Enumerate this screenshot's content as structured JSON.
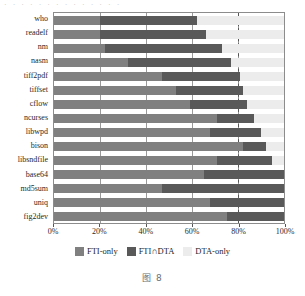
{
  "top_partial_text": "· · · · · · · · · · · · · ·",
  "caption": "图 8",
  "legend": {
    "position": "bottom-center",
    "items": [
      {
        "label": "FTI-only",
        "color": "#808080",
        "key": "fti_only"
      },
      {
        "label": "FTI∩DTA",
        "color": "#595959",
        "key": "fti_dta"
      },
      {
        "label": "DTA-only",
        "color": "#ececec",
        "key": "dta_only"
      }
    ]
  },
  "axis": {
    "ticks": [
      0,
      20,
      40,
      60,
      80,
      100
    ],
    "tick_labels": [
      "0%",
      "20%",
      "40%",
      "60%",
      "80%",
      "100%"
    ],
    "reference_line_at": 80
  },
  "chart_data": {
    "type": "bar",
    "orientation": "horizontal",
    "stacked": true,
    "normalized_percent": true,
    "title": "",
    "xlabel": "",
    "ylabel": "",
    "xlim": [
      0,
      100
    ],
    "grid": true,
    "legend_position": "bottom",
    "categories": [
      "who",
      "readelf",
      "nm",
      "nasm",
      "tiff2pdf",
      "tiffset",
      "cflow",
      "ncurses",
      "libwpd",
      "bison",
      "libsndfile",
      "base64",
      "md5sum",
      "uniq",
      "fig2dev"
    ],
    "series": [
      {
        "name": "FTI-only",
        "color": "#808080",
        "values": [
          20,
          20,
          22,
          32,
          47,
          53,
          59,
          71,
          68,
          82,
          71,
          65,
          47,
          68,
          75
        ]
      },
      {
        "name": "FTI∩DTA",
        "color": "#595959",
        "values": [
          42,
          46,
          51,
          45,
          34,
          29,
          25,
          16,
          22,
          10,
          24,
          35,
          53,
          32,
          25
        ]
      },
      {
        "name": "DTA-only",
        "color": "#ececec",
        "values": [
          38,
          34,
          27,
          23,
          19,
          18,
          16,
          13,
          10,
          8,
          5,
          0,
          0,
          0,
          0
        ]
      }
    ],
    "cumulative_boundaries": [
      {
        "category": "who",
        "fti_only_end": 20,
        "fti_dta_end": 62
      },
      {
        "category": "readelf",
        "fti_only_end": 20,
        "fti_dta_end": 66
      },
      {
        "category": "nm",
        "fti_only_end": 22,
        "fti_dta_end": 73
      },
      {
        "category": "nasm",
        "fti_only_end": 32,
        "fti_dta_end": 77
      },
      {
        "category": "tiff2pdf",
        "fti_only_end": 47,
        "fti_dta_end": 81
      },
      {
        "category": "tiffset",
        "fti_only_end": 53,
        "fti_dta_end": 82
      },
      {
        "category": "cflow",
        "fti_only_end": 59,
        "fti_dta_end": 84
      },
      {
        "category": "ncurses",
        "fti_only_end": 71,
        "fti_dta_end": 87
      },
      {
        "category": "libwpd",
        "fti_only_end": 68,
        "fti_dta_end": 90
      },
      {
        "category": "bison",
        "fti_only_end": 82,
        "fti_dta_end": 92
      },
      {
        "category": "libsndfile",
        "fti_only_end": 71,
        "fti_dta_end": 95
      },
      {
        "category": "base64",
        "fti_only_end": 65,
        "fti_dta_end": 100
      },
      {
        "category": "md5sum",
        "fti_only_end": 47,
        "fti_dta_end": 100
      },
      {
        "category": "uniq",
        "fti_only_end": 68,
        "fti_dta_end": 100
      },
      {
        "category": "fig2dev",
        "fti_only_end": 75,
        "fti_dta_end": 100
      }
    ]
  }
}
